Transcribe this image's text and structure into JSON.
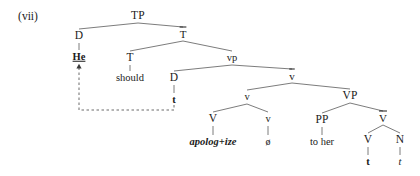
{
  "figure": {
    "example_label": "(vii)",
    "type": "syntax-tree"
  },
  "nodes": [
    {
      "id": "TP",
      "label": "TP",
      "x": 138,
      "y": 16,
      "style": "cat"
    },
    {
      "id": "D1",
      "label": "D",
      "x": 79,
      "y": 36,
      "style": "cat"
    },
    {
      "id": "He",
      "label": "He",
      "x": 79,
      "y": 57,
      "style": "underlined"
    },
    {
      "id": "Tbar",
      "label": "T",
      "x": 183,
      "y": 34,
      "style": "bar"
    },
    {
      "id": "T",
      "label": "T",
      "x": 130,
      "y": 58,
      "style": "cat"
    },
    {
      "id": "should",
      "label": "should",
      "x": 130,
      "y": 78,
      "style": "word"
    },
    {
      "id": "vp",
      "label": "vp",
      "x": 232,
      "y": 58,
      "style": "small-cat"
    },
    {
      "id": "D2",
      "label": "D",
      "x": 174,
      "y": 78,
      "style": "cat"
    },
    {
      "id": "t1",
      "label": "t",
      "x": 174,
      "y": 100,
      "style": "trace-bold"
    },
    {
      "id": "vbar",
      "label": "v",
      "x": 292,
      "y": 76,
      "style": "bar"
    },
    {
      "id": "v",
      "label": "v",
      "x": 247,
      "y": 97,
      "style": "small-cat"
    },
    {
      "id": "V1",
      "label": "V",
      "x": 213,
      "y": 119,
      "style": "cat"
    },
    {
      "id": "apolog",
      "label": "apolog+ize",
      "x": 213,
      "y": 142,
      "style": "verbform"
    },
    {
      "id": "v2",
      "label": "v",
      "x": 268,
      "y": 119,
      "style": "small-cat"
    },
    {
      "id": "null",
      "label": "ø",
      "x": 268,
      "y": 142,
      "style": "null-sym"
    },
    {
      "id": "VP",
      "label": "VP",
      "x": 350,
      "y": 96,
      "style": "cat"
    },
    {
      "id": "PP",
      "label": "PP",
      "x": 322,
      "y": 120,
      "style": "cat"
    },
    {
      "id": "tohher",
      "label": "to her",
      "x": 322,
      "y": 142,
      "style": "word"
    },
    {
      "id": "Vbar",
      "label": "V",
      "x": 383,
      "y": 118,
      "style": "bar"
    },
    {
      "id": "V2",
      "label": "V",
      "x": 368,
      "y": 140,
      "style": "cat"
    },
    {
      "id": "t2",
      "label": "t",
      "x": 368,
      "y": 162,
      "style": "trace-bold"
    },
    {
      "id": "N",
      "label": "N",
      "x": 400,
      "y": 140,
      "style": "cat"
    },
    {
      "id": "t3",
      "label": "t",
      "x": 400,
      "y": 162,
      "style": "trace-ital"
    }
  ],
  "branches": [
    {
      "from": "TP",
      "to": "D1"
    },
    {
      "from": "TP",
      "to": "Tbar"
    },
    {
      "from": "D1",
      "to": "He"
    },
    {
      "from": "Tbar",
      "to": "T"
    },
    {
      "from": "Tbar",
      "to": "vp"
    },
    {
      "from": "T",
      "to": "should"
    },
    {
      "from": "vp",
      "to": "D2"
    },
    {
      "from": "vp",
      "to": "vbar"
    },
    {
      "from": "D2",
      "to": "t1"
    },
    {
      "from": "vbar",
      "to": "v"
    },
    {
      "from": "vbar",
      "to": "VP"
    },
    {
      "from": "v",
      "to": "V1"
    },
    {
      "from": "v",
      "to": "v2"
    },
    {
      "from": "V1",
      "to": "apolog"
    },
    {
      "from": "v2",
      "to": "null"
    },
    {
      "from": "VP",
      "to": "PP"
    },
    {
      "from": "VP",
      "to": "Vbar"
    },
    {
      "from": "PP",
      "to": "tohher"
    },
    {
      "from": "Vbar",
      "to": "V2"
    },
    {
      "from": "Vbar",
      "to": "N"
    },
    {
      "from": "V2",
      "to": "t2"
    },
    {
      "from": "N",
      "to": "t3"
    }
  ],
  "movement_arrow": {
    "name": "dp-movement-arrow",
    "from_trace": "t1",
    "to_node": "He",
    "path": "M 174 105 L 174 110 L 79 110 L 79 68"
  },
  "colors": {
    "ink": "#1a1a1a",
    "line": "#6d6d6d",
    "background": "#ffffff"
  }
}
